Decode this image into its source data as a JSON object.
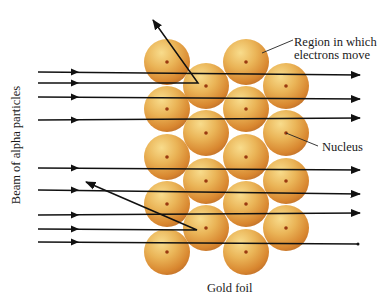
{
  "labels": {
    "region_line1": "Region in which",
    "region_line2": "electrons move",
    "nucleus": "Nucleus",
    "gold_foil": "Gold foil",
    "beam": "Beam of alpha particles"
  },
  "colors": {
    "sphere_light": "#f6d27a",
    "sphere_mid": "#e8a848",
    "sphere_dark": "#c9772a",
    "nucleus_dot": "#9a3a10",
    "line": "#111111"
  },
  "atoms": [
    {
      "cx": 167,
      "cy": 62
    },
    {
      "cx": 167,
      "cy": 109
    },
    {
      "cx": 167,
      "cy": 157
    },
    {
      "cx": 167,
      "cy": 204
    },
    {
      "cx": 167,
      "cy": 252
    },
    {
      "cx": 206,
      "cy": 86
    },
    {
      "cx": 206,
      "cy": 133
    },
    {
      "cx": 206,
      "cy": 181
    },
    {
      "cx": 206,
      "cy": 228
    },
    {
      "cx": 246,
      "cy": 62
    },
    {
      "cx": 246,
      "cy": 109
    },
    {
      "cx": 246,
      "cy": 157
    },
    {
      "cx": 246,
      "cy": 204
    },
    {
      "cx": 246,
      "cy": 252
    },
    {
      "cx": 286,
      "cy": 86
    },
    {
      "cx": 286,
      "cy": 133
    },
    {
      "cx": 286,
      "cy": 181
    },
    {
      "cx": 286,
      "cy": 228
    }
  ],
  "atom_radius": 23,
  "paths": [
    {
      "type": "pass",
      "points": [
        [
          38,
          72
        ],
        [
          360,
          75
        ]
      ],
      "arrow_x": 75
    },
    {
      "type": "deflect-back",
      "points": [
        [
          38,
          83
        ],
        [
          198,
          83
        ],
        [
          153,
          20
        ]
      ],
      "arrow_x": 75
    },
    {
      "type": "pass",
      "points": [
        [
          38,
          97
        ],
        [
          360,
          99
        ]
      ],
      "arrow_x": 75
    },
    {
      "type": "pass",
      "points": [
        [
          38,
          120
        ],
        [
          360,
          118
        ]
      ],
      "arrow_x": 75
    },
    {
      "type": "pass",
      "points": [
        [
          38,
          168
        ],
        [
          360,
          170
        ]
      ],
      "arrow_x": 75
    },
    {
      "type": "pass",
      "points": [
        [
          38,
          190
        ],
        [
          360,
          194
        ]
      ],
      "arrow_x": 75
    },
    {
      "type": "pass",
      "points": [
        [
          38,
          215
        ],
        [
          360,
          213
        ]
      ],
      "arrow_x": 75
    },
    {
      "type": "reflect",
      "points": [
        [
          38,
          229
        ],
        [
          197,
          230
        ],
        [
          86,
          182
        ]
      ],
      "arrow_x": 75
    },
    {
      "type": "pass-end",
      "points": [
        [
          38,
          242
        ],
        [
          358,
          244
        ]
      ],
      "arrow_x": 75
    }
  ],
  "leaders": [
    {
      "name": "region-leader",
      "from": [
        262,
        53
      ],
      "to": [
        293,
        40
      ]
    },
    {
      "name": "nucleus-leader",
      "from": [
        286,
        133
      ],
      "to": [
        318,
        146
      ]
    }
  ]
}
